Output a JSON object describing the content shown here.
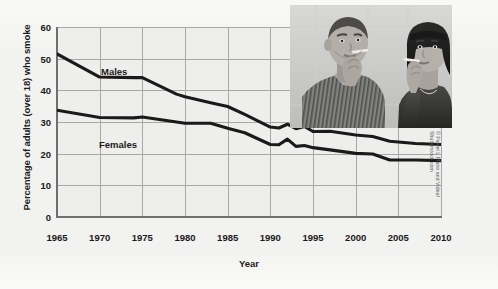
{
  "chart_data": {
    "type": "line",
    "title": "",
    "xlabel": "Year",
    "ylabel": "Percentage of adults (over 18) who smoke",
    "xlim": [
      1965,
      2010
    ],
    "ylim": [
      0,
      60
    ],
    "grid": true,
    "legend_position": "inline-labels",
    "xticks": [
      "1965",
      "1970",
      "1975",
      "1980",
      "1985",
      "1990",
      "1995",
      "2000",
      "2005",
      "2010"
    ],
    "yticks": [
      "0",
      "10",
      "20",
      "30",
      "40",
      "50",
      "60"
    ],
    "x": [
      1965,
      1970,
      1974,
      1975,
      1979,
      1980,
      1983,
      1985,
      1987,
      1990,
      1991,
      1992,
      1993,
      1994,
      1995,
      1997,
      2000,
      2002,
      2004,
      2005,
      2007,
      2010
    ],
    "series": [
      {
        "name": "Males",
        "label": "Males",
        "color": "#1a1a1a",
        "values": [
          51.5,
          44.2,
          44.0,
          44.0,
          38.8,
          38.0,
          36.1,
          34.9,
          32.4,
          28.4,
          28.1,
          29.3,
          27.9,
          28.6,
          27.0,
          27.1,
          25.9,
          25.4,
          23.9,
          23.7,
          23.2,
          22.9
        ]
      },
      {
        "name": "Females",
        "label": "Females",
        "color": "#1a1a1a",
        "values": [
          33.7,
          31.4,
          31.3,
          31.6,
          30.0,
          29.6,
          29.6,
          28.0,
          26.6,
          22.9,
          22.8,
          24.6,
          22.3,
          22.6,
          21.9,
          21.2,
          20.1,
          19.9,
          18.0,
          18.0,
          18.0,
          17.8
        ]
      }
    ],
    "annotations": [
      {
        "text": "Males",
        "x": 1970.5,
        "y": 47.5
      },
      {
        "text": "Females",
        "x": 1970.0,
        "y": 27.5
      }
    ]
  },
  "photo": {
    "alt": "man-and-woman-smoking-photo",
    "credit": "© Pawel L Photo and Video/\nShutterstock.com"
  },
  "colors": {
    "page_background": "#f2f2f0",
    "plot_background": "#eeeeec",
    "gridline": "#a8a8a6",
    "axis": "#6f6f6d",
    "line": "#1a1a1a",
    "text": "#1b1b1b",
    "credit_text": "#5a5a58"
  }
}
